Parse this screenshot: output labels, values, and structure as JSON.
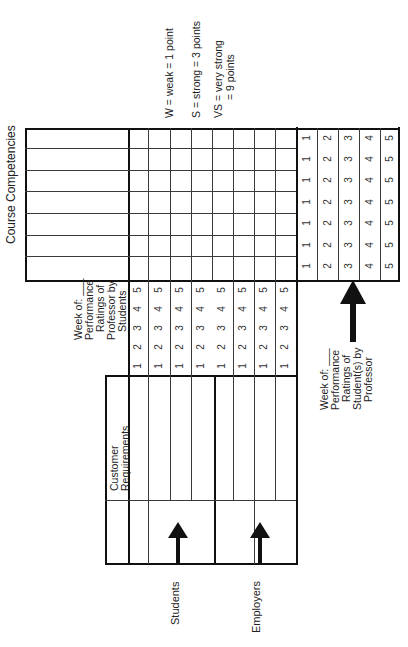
{
  "title": "Course Competencies",
  "legend": {
    "weak": "W = weak = 1 point",
    "strong": "S = strong = 3 points",
    "very_strong_1": "VS = very strong",
    "very_strong_2": "= 9 points"
  },
  "professor_ratings_label": {
    "line1": "Week of: ___",
    "line2": "Performance",
    "line3": "Ratings of",
    "line4": "Professor by",
    "line5": "Students"
  },
  "student_ratings_label": {
    "line1": "Week of: ___",
    "line2": "Performance",
    "line3": "Ratings of",
    "line4": "Student(s) by",
    "line5": "Professor"
  },
  "customer_requirements_label": {
    "line1": "Customer",
    "line2": "Requirements"
  },
  "customers": {
    "students": "Students",
    "employers": "Employers"
  },
  "rating_scale": [
    "1",
    "2",
    "3",
    "4",
    "5"
  ],
  "competency_rows": 7,
  "requirement_columns": 8,
  "colors": {
    "line": "#3a3a3a",
    "thick": "#111111",
    "text": "#222222"
  }
}
